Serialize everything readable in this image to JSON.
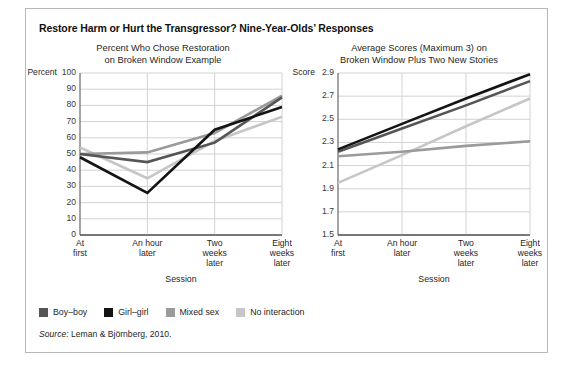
{
  "figure": {
    "title": "Restore Harm or Hurt the Transgressor? Nine-Year-Olds’ Responses",
    "source_label": "Source:",
    "source_text": " Leman & Björnberg, 2010."
  },
  "legend": {
    "items": [
      {
        "label": "Boy–boy",
        "color": "#555555"
      },
      {
        "label": "Girl–girl",
        "color": "#141414"
      },
      {
        "label": "Mixed sex",
        "color": "#9a9a9a"
      },
      {
        "label": "No interaction",
        "color": "#c6c6c6"
      }
    ]
  },
  "chart_data": [
    {
      "type": "line",
      "title": "Percent Who Chose Restoration\non Broken Window Example",
      "title_line1": "Percent Who Chose Restoration",
      "title_line2": "on Broken Window Example",
      "xlabel": "Session",
      "ylabel": "Percent",
      "ylim": [
        0,
        100
      ],
      "yticks": [
        0,
        10,
        20,
        30,
        40,
        50,
        60,
        70,
        80,
        90,
        100
      ],
      "ytick_labels": [
        "0",
        "10",
        "20",
        "30",
        "40",
        "50",
        "60",
        "70",
        "80",
        "90",
        "100"
      ],
      "categories": [
        "At first",
        "An hour later",
        "Two weeks later",
        "Eight weeks later"
      ],
      "category_lines": [
        [
          "At",
          "first"
        ],
        [
          "An hour",
          "later"
        ],
        [
          "Two",
          "weeks",
          "later"
        ],
        [
          "Eight",
          "weeks",
          "later"
        ]
      ],
      "grid": true,
      "legend_position": "below-figure",
      "series": [
        {
          "name": "Boy–boy",
          "color": "#555555",
          "values": [
            50,
            45,
            57,
            85
          ]
        },
        {
          "name": "Girl–girl",
          "color": "#141414",
          "values": [
            48,
            26,
            65,
            79
          ]
        },
        {
          "name": "Mixed sex",
          "color": "#9a9a9a",
          "values": [
            50,
            51,
            63,
            86
          ]
        },
        {
          "name": "No interaction",
          "color": "#c6c6c6",
          "values": [
            54,
            35,
            58,
            73
          ]
        }
      ]
    },
    {
      "type": "line",
      "title": "Average Scores (Maximum 3) on\nBroken Window Plus Two New Stories",
      "title_line1": "Average Scores (Maximum 3) on",
      "title_line2": "Broken Window Plus Two New Stories",
      "xlabel": "Session",
      "ylabel": "Score",
      "ylim": [
        1.5,
        2.9
      ],
      "yticks": [
        1.5,
        1.7,
        1.9,
        2.1,
        2.3,
        2.5,
        2.7,
        2.9
      ],
      "ytick_labels": [
        "1.5",
        "1.7",
        "1.9",
        "2.1",
        "2.3",
        "2.5",
        "2.7",
        "2.9"
      ],
      "categories": [
        "At first",
        "An hour later",
        "Two weeks later",
        "Eight weeks later"
      ],
      "category_lines": [
        [
          "At",
          "first"
        ],
        [
          "An hour",
          "later"
        ],
        [
          "Two",
          "weeks",
          "later"
        ],
        [
          "Eight",
          "weeks",
          "later"
        ]
      ],
      "grid": true,
      "legend_position": "below-figure",
      "series": [
        {
          "name": "Boy–boy",
          "color": "#555555",
          "values": [
            2.22,
            2.42,
            2.62,
            2.83
          ]
        },
        {
          "name": "Girl–girl",
          "color": "#141414",
          "values": [
            2.24,
            2.46,
            2.68,
            2.89
          ]
        },
        {
          "name": "Mixed sex",
          "color": "#9a9a9a",
          "values": [
            2.18,
            2.22,
            2.27,
            2.31
          ]
        },
        {
          "name": "No interaction",
          "color": "#c6c6c6",
          "values": [
            1.95,
            2.19,
            2.44,
            2.68
          ]
        }
      ]
    }
  ]
}
